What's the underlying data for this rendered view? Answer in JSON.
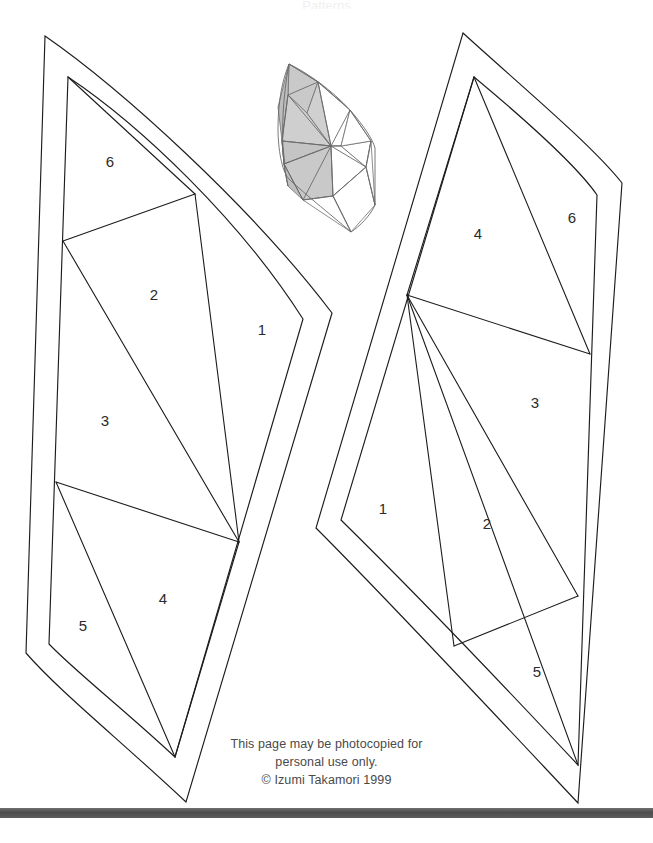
{
  "page": {
    "background_color": "#ffffff",
    "line_color": "#1c1c1c",
    "width": 653,
    "height": 843
  },
  "top_ghost_text": "Patterns",
  "footer": {
    "line1": "This page may be photocopied for",
    "line2": "personal use only.",
    "line3": "© Izumi Takamori 1999"
  },
  "bottom_bar": {
    "color": "#4e4e4e",
    "label": "page-edge-bar"
  },
  "thumbnail": {
    "label": "shaded-reference-diagram",
    "shaded_color": "#c9c9c9",
    "unshaded_color": "#ffffff",
    "stroke_color": "#6a6a6a"
  },
  "templates": [
    {
      "id": "left-template",
      "label": "Left petal template",
      "mirrored": false,
      "pieces": [
        {
          "number": "1",
          "x": 262,
          "y": 331
        },
        {
          "number": "2",
          "x": 154,
          "y": 296
        },
        {
          "number": "3",
          "x": 105,
          "y": 422
        },
        {
          "number": "4",
          "x": 163,
          "y": 600
        },
        {
          "number": "5",
          "x": 83,
          "y": 627
        },
        {
          "number": "6",
          "x": 110,
          "y": 163
        }
      ]
    },
    {
      "id": "right-template",
      "label": "Right petal template",
      "mirrored": true,
      "pieces": [
        {
          "number": "1",
          "x": 383,
          "y": 510
        },
        {
          "number": "2",
          "x": 487,
          "y": 525
        },
        {
          "number": "3",
          "x": 535,
          "y": 404
        },
        {
          "number": "4",
          "x": 478,
          "y": 235
        },
        {
          "number": "5",
          "x": 537,
          "y": 673
        },
        {
          "number": "6",
          "x": 572,
          "y": 219
        }
      ]
    }
  ],
  "geometry": {
    "left_outer": "M 45 36 L 332 313 L 186 802 L 26 653 Z",
    "left_inner": "M 68 77 L 303 319 L 175 757 L 49 644 Z",
    "left_seams": [
      "M 68 77 L 195 194",
      "M 195 194 L 63 241",
      "M 195 194 L 239 542",
      "M 63 241 L 239 542",
      "M 56 482 L 239 542",
      "M 56 482 L 175 757",
      "M 239 542 L 175 757"
    ],
    "right_outer": "M 463 33 L 622 183 L 578 803 L 316 528 Z",
    "right_inner": "M 474 77 L 597 195 L 578 765 L 341 520 Z",
    "right_seams": [
      "M 474 77 L 590 354",
      "M 474 77 L 407 295",
      "M 407 295 L 590 354",
      "M 407 295 L 454 646",
      "M 407 295 L 578 765",
      "M 454 646 L 578 596",
      "M 578 596 L 407 295"
    ]
  }
}
